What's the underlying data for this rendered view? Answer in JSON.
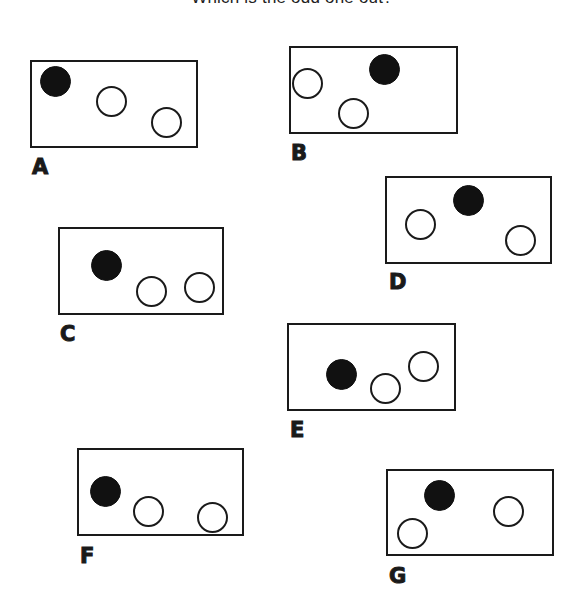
{
  "title": "Which is the odd one out?",
  "colors": {
    "ink": "#1a1a1a",
    "filled_circle": "#111111",
    "background": "#ffffff"
  },
  "panels": [
    {
      "label": "A",
      "box": {
        "x": 30,
        "y": 60,
        "w": 168,
        "h": 88
      },
      "label_pos": {
        "x": 32,
        "y": 157
      },
      "circles": [
        {
          "type": "filled",
          "cx": 55,
          "cy": 81
        },
        {
          "type": "empty",
          "cx": 111,
          "cy": 101
        },
        {
          "type": "empty",
          "cx": 166,
          "cy": 122
        }
      ]
    },
    {
      "label": "B",
      "box": {
        "x": 289,
        "y": 46,
        "w": 169,
        "h": 88
      },
      "label_pos": {
        "x": 291,
        "y": 143
      },
      "circles": [
        {
          "type": "filled",
          "cx": 384,
          "cy": 69
        },
        {
          "type": "empty",
          "cx": 307,
          "cy": 83
        },
        {
          "type": "empty",
          "cx": 353,
          "cy": 113
        }
      ]
    },
    {
      "label": "C",
      "box": {
        "x": 58,
        "y": 227,
        "w": 166,
        "h": 88
      },
      "label_pos": {
        "x": 60,
        "y": 324
      },
      "circles": [
        {
          "type": "filled",
          "cx": 106,
          "cy": 265
        },
        {
          "type": "empty",
          "cx": 151,
          "cy": 291
        },
        {
          "type": "empty",
          "cx": 199,
          "cy": 287
        }
      ]
    },
    {
      "label": "D",
      "box": {
        "x": 385,
        "y": 176,
        "w": 167,
        "h": 88
      },
      "label_pos": {
        "x": 389,
        "y": 272
      },
      "circles": [
        {
          "type": "filled",
          "cx": 468,
          "cy": 200
        },
        {
          "type": "empty",
          "cx": 420,
          "cy": 224
        },
        {
          "type": "empty",
          "cx": 520,
          "cy": 240
        }
      ]
    },
    {
      "label": "E",
      "box": {
        "x": 287,
        "y": 323,
        "w": 169,
        "h": 88
      },
      "label_pos": {
        "x": 290,
        "y": 420
      },
      "circles": [
        {
          "type": "filled",
          "cx": 341,
          "cy": 374
        },
        {
          "type": "empty",
          "cx": 385,
          "cy": 388
        },
        {
          "type": "empty",
          "cx": 423,
          "cy": 366
        }
      ]
    },
    {
      "label": "F",
      "box": {
        "x": 77,
        "y": 448,
        "w": 167,
        "h": 88
      },
      "label_pos": {
        "x": 80,
        "y": 546
      },
      "circles": [
        {
          "type": "filled",
          "cx": 105,
          "cy": 491
        },
        {
          "type": "empty",
          "cx": 148,
          "cy": 511
        },
        {
          "type": "empty",
          "cx": 212,
          "cy": 517
        }
      ]
    },
    {
      "label": "G",
      "box": {
        "x": 386,
        "y": 469,
        "w": 168,
        "h": 87
      },
      "label_pos": {
        "x": 389,
        "y": 566
      },
      "circles": [
        {
          "type": "filled",
          "cx": 439,
          "cy": 495
        },
        {
          "type": "empty",
          "cx": 412,
          "cy": 533
        },
        {
          "type": "empty",
          "cx": 508,
          "cy": 511
        }
      ]
    }
  ]
}
